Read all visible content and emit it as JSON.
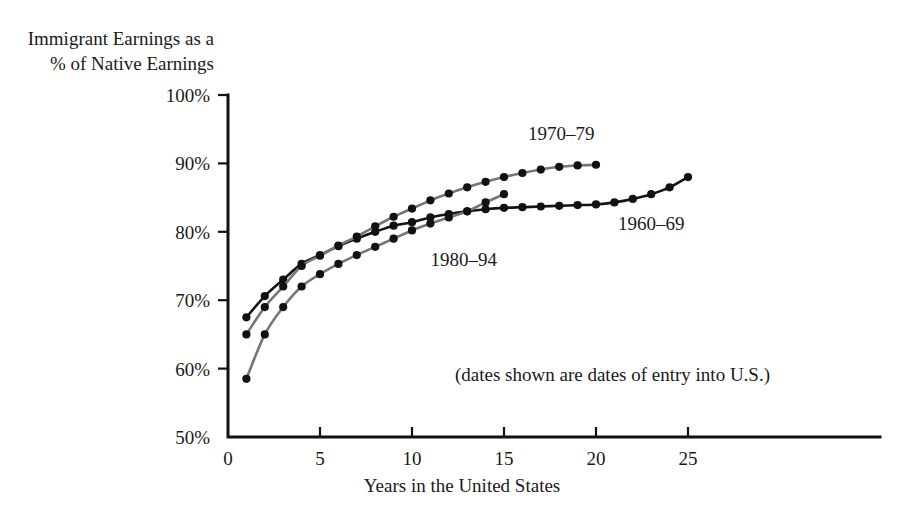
{
  "chart_data": {
    "type": "line",
    "title": "",
    "ylabel_line1": "Immigrant Earnings as a",
    "ylabel_line2": "% of Native Earnings",
    "xlabel": "Years in the United States",
    "note": "(dates shown are dates of entry into U.S.)",
    "xlim": [
      0,
      27
    ],
    "ylim": [
      50,
      100
    ],
    "grid": false,
    "legend_position": "inline-annotations",
    "xticks": [
      0,
      5,
      10,
      15,
      20,
      25
    ],
    "xtick_labels": [
      "0",
      "5",
      "10",
      "15",
      "20",
      "25"
    ],
    "yticks": [
      50,
      60,
      70,
      80,
      90,
      100
    ],
    "ytick_labels": [
      "50%",
      "60%",
      "70%",
      "80%",
      "90%",
      "100%"
    ],
    "series": [
      {
        "name": "1960-69",
        "label": "1960–69",
        "color": "#141414",
        "label_x": 21.2,
        "label_y": 80.2,
        "x": [
          1,
          2,
          3,
          4,
          5,
          6,
          7,
          8,
          9,
          10,
          11,
          12,
          13,
          14,
          15,
          16,
          17,
          18,
          19,
          20,
          21,
          22,
          23,
          24,
          25
        ],
        "values": [
          67.5,
          70.6,
          73.0,
          75.3,
          76.6,
          77.9,
          79.0,
          80.0,
          80.9,
          81.4,
          82.1,
          82.6,
          83.0,
          83.3,
          83.5,
          83.6,
          83.7,
          83.8,
          83.9,
          84.0,
          84.3,
          84.8,
          85.5,
          86.5,
          88.0
        ]
      },
      {
        "name": "1970-79",
        "label": "1970–79",
        "color": "#767676",
        "label_x": 16.3,
        "label_y": 93.4,
        "x": [
          1,
          2,
          3,
          4,
          5,
          6,
          7,
          8,
          9,
          10,
          11,
          12,
          13,
          14,
          15,
          16,
          17,
          18,
          19,
          20
        ],
        "values": [
          65.0,
          69.0,
          72.0,
          75.0,
          76.5,
          78.0,
          79.3,
          80.8,
          82.2,
          83.4,
          84.6,
          85.6,
          86.5,
          87.3,
          88.0,
          88.6,
          89.1,
          89.5,
          89.7,
          89.8
        ]
      },
      {
        "name": "1980-94",
        "label": "1980–94",
        "color": "#767676",
        "label_x": 11.0,
        "label_y": 75.0,
        "x": [
          1,
          2,
          3,
          4,
          5,
          6,
          7,
          8,
          9,
          10,
          11,
          12,
          13,
          14,
          15
        ],
        "values": [
          58.5,
          65.0,
          69.0,
          72.0,
          73.8,
          75.3,
          76.6,
          77.8,
          79.0,
          80.2,
          81.2,
          82.1,
          83.0,
          84.3,
          85.5
        ]
      }
    ]
  }
}
